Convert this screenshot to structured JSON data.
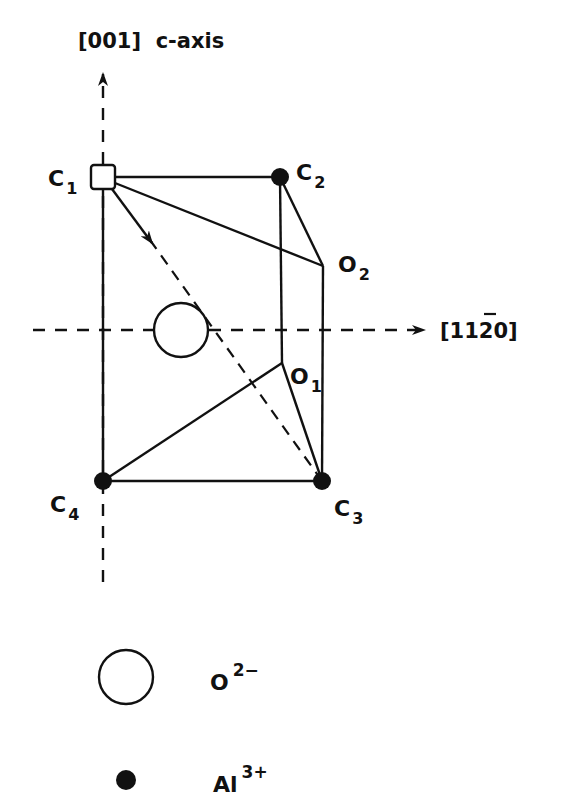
{
  "diagram": {
    "type": "crystal-structure",
    "colors": {
      "ink": "#111111",
      "background": "#ffffff"
    },
    "axes": {
      "vertical": {
        "label": "[001]  c-axis"
      },
      "horizontal": {
        "label_prefix": "[11",
        "label_bar_digit": "2",
        "label_suffix": "0]"
      }
    },
    "sites": [
      {
        "id": "C1",
        "letter": "C",
        "subscript": "1",
        "marker": "square"
      },
      {
        "id": "C2",
        "letter": "C",
        "subscript": "2",
        "marker": "filled-circle"
      },
      {
        "id": "C3",
        "letter": "C",
        "subscript": "3",
        "marker": "filled-circle"
      },
      {
        "id": "C4",
        "letter": "C",
        "subscript": "4",
        "marker": "filled-circle"
      },
      {
        "id": "O1",
        "letter": "O",
        "subscript": "1",
        "marker": "vertex"
      },
      {
        "id": "O2",
        "letter": "O",
        "subscript": "2",
        "marker": "vertex"
      }
    ],
    "legend": [
      {
        "symbol": "open-circle",
        "base": "O",
        "superscript": "2−"
      },
      {
        "symbol": "filled-circle",
        "base": "Al",
        "superscript": "3+"
      }
    ]
  }
}
